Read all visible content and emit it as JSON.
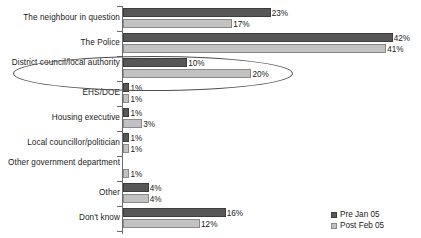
{
  "chart_data": {
    "type": "bar",
    "orientation": "horizontal",
    "title": "",
    "xlabel": "",
    "ylabel": "",
    "xlim": [
      0,
      45
    ],
    "grid": false,
    "value_suffix": "%",
    "legend_position": "bottom-right",
    "categories": [
      "The neighbour in question",
      "The Police",
      "District council/local authority",
      "EHS/DOE",
      "Housing executive",
      "Local councillor/politician",
      "Other government department",
      "Other",
      "Don't know"
    ],
    "series": [
      {
        "name": "Pre Jan 05",
        "color": "#575757",
        "values": [
          23,
          42,
          10,
          1,
          1,
          1,
          0,
          4,
          16
        ],
        "labels": [
          "23%",
          "42%",
          "10%",
          "1%",
          "1%",
          "1%",
          "",
          "4%",
          "16%"
        ]
      },
      {
        "name": "Post Feb 05",
        "color": "#c2c2c2",
        "values": [
          17,
          41,
          20,
          1,
          3,
          1,
          1,
          4,
          12
        ],
        "labels": [
          "17%",
          "41%",
          "20%",
          "1%",
          "3%",
          "1%",
          "1%",
          "4%",
          "12%"
        ]
      }
    ],
    "annotations": [
      {
        "type": "ellipse",
        "name": "district-council-highlight",
        "target_category": "District council/local authority"
      }
    ]
  },
  "legend": {
    "items": [
      {
        "label": "Pre Jan 05",
        "swatch": "pre"
      },
      {
        "label": "Post Feb 05",
        "swatch": "post"
      }
    ]
  }
}
